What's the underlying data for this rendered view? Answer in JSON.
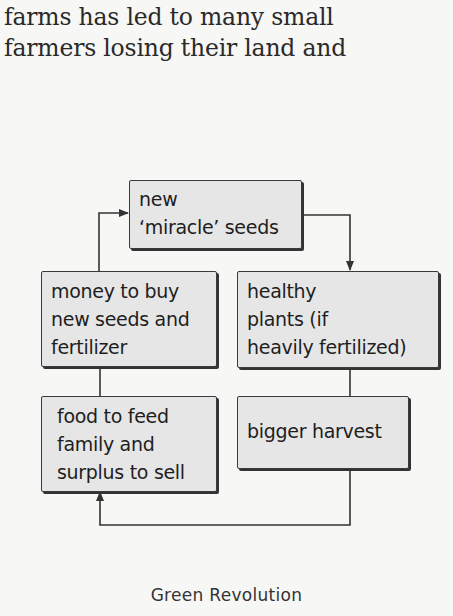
{
  "body_text": {
    "lines": [
      "farms has led to many small",
      "farmers losing their land and"
    ]
  },
  "diagram": {
    "title": "Green Revolution",
    "nodes": [
      {
        "id": "seeds",
        "lines": [
          "new",
          "‘miracle’ seeds"
        ]
      },
      {
        "id": "plants",
        "lines": [
          "healthy",
          "plants (if",
          "heavily fertilized)"
        ]
      },
      {
        "id": "harvest",
        "lines": [
          "bigger harvest"
        ]
      },
      {
        "id": "food",
        "lines": [
          "food to feed",
          "family and",
          "surplus to sell"
        ]
      },
      {
        "id": "money",
        "lines": [
          "money to buy",
          "new seeds and",
          "fertilizer"
        ]
      }
    ],
    "edges": [
      {
        "from": "seeds",
        "to": "plants",
        "arrow": true
      },
      {
        "from": "plants",
        "to": "harvest",
        "arrow": false
      },
      {
        "from": "harvest",
        "to": "food",
        "arrow": true
      },
      {
        "from": "food",
        "to": "money",
        "arrow": false
      },
      {
        "from": "money",
        "to": "seeds",
        "arrow": true
      }
    ],
    "colors": {
      "box_fill": "#e6e6e6",
      "box_border": "#3a3a3a",
      "line": "#333333",
      "background": "#f7f7f5"
    }
  }
}
